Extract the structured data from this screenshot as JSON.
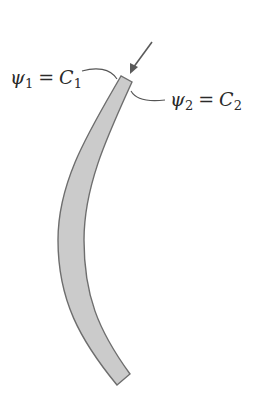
{
  "figure": {
    "colors": {
      "band_fill": "#cbcbcb",
      "band_stroke": "#6e6e6e",
      "leader_line": "#555555",
      "arrow": "#5a5a5a",
      "text": "#2a2a2a",
      "background": "#ffffff"
    },
    "labels": {
      "left": {
        "symbol": "ψ",
        "subscript": "1",
        "equals": "=",
        "constant": "C",
        "constant_subscript": "1"
      },
      "right": {
        "symbol": "ψ",
        "subscript": "2",
        "equals": "=",
        "constant": "C",
        "constant_subscript": "2"
      }
    },
    "arrow": {
      "direction": "down-left",
      "from": [
        152,
        42
      ],
      "to": [
        130,
        73
      ]
    }
  }
}
